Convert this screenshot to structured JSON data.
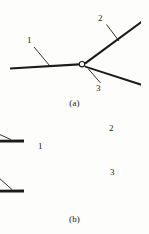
{
  "figure": {
    "width": 149,
    "height": 234,
    "background_color": "#fdfdfc",
    "ink_color": "#1b1b1b"
  },
  "panels": [
    {
      "id": "a",
      "caption": "(a)",
      "description": "Y-junction of three transmission lines meeting at a small circular node",
      "node": {
        "shape": "circle",
        "cx": 82,
        "cy": 64,
        "r": 2.6
      },
      "branches": [
        {
          "label": "1",
          "direction": "left",
          "from": [
            82,
            64
          ],
          "to": [
            10,
            68
          ]
        },
        {
          "label": "2",
          "direction": "upper-right",
          "from": [
            82,
            64
          ],
          "to": [
            141,
            22
          ]
        },
        {
          "label": "3",
          "direction": "lower-right",
          "from": [
            82,
            64
          ],
          "to": [
            141,
            85
          ]
        }
      ],
      "labels": [
        {
          "text": "1",
          "x": 27,
          "y": 36,
          "leader_from": [
            34,
            48
          ],
          "leader_to": [
            49,
            66
          ]
        },
        {
          "text": "2",
          "x": 98,
          "y": 14,
          "leader_from": [
            107,
            25
          ],
          "leader_to": [
            119,
            41
          ]
        },
        {
          "text": "3",
          "x": 96,
          "y": 84,
          "leader_from": [
            101,
            83
          ],
          "leader_to": [
            89,
            69
          ]
        }
      ]
    },
    {
      "id": "b",
      "caption": "(b)",
      "description": "Equivalent circuit of the Y-junction: an input line feeding a vertical bus with two shunt capacitors and three directional arrowheads leading to output ports 2 and 3",
      "components": [
        {
          "type": "capacitor",
          "name": "upper-shunt-capacitor",
          "orientation": "vertical-plates",
          "x": 78,
          "y_top": 128,
          "y_bottom": 156
        },
        {
          "type": "capacitor",
          "name": "lower-shunt-capacitor",
          "orientation": "vertical-plates",
          "x": 78,
          "y_top": 176,
          "y_bottom": 204
        },
        {
          "type": "arrowhead",
          "name": "input-arrowhead",
          "x": 78,
          "y": 166,
          "points": "right"
        },
        {
          "type": "arrowhead",
          "name": "port-2-arrowhead",
          "x": 88,
          "y": 141,
          "points": "right"
        },
        {
          "type": "arrowhead",
          "name": "port-3-arrowhead",
          "x": 88,
          "y": 191,
          "points": "right"
        }
      ],
      "ports": [
        {
          "label": "1",
          "side": "left",
          "line_from": [
            12,
            166
          ],
          "line_to": [
            78,
            166
          ]
        },
        {
          "label": "2",
          "side": "right",
          "line_from": [
            88,
            141
          ],
          "line_to": [
            141,
            141
          ]
        },
        {
          "label": "3",
          "side": "right",
          "line_from": [
            88,
            191
          ],
          "line_to": [
            141,
            191
          ]
        }
      ],
      "labels": [
        {
          "text": "1",
          "x": 38,
          "y": 142,
          "leader_from": [
            44,
            153
          ],
          "leader_to": [
            56,
            165
          ]
        },
        {
          "text": "2",
          "x": 109,
          "y": 124,
          "leader_from": [
            115,
            134
          ],
          "leader_to": [
            128,
            140
          ]
        },
        {
          "text": "3",
          "x": 110,
          "y": 168,
          "leader_from": [
            116,
            178
          ],
          "leader_to": [
            129,
            190
          ]
        }
      ]
    }
  ]
}
